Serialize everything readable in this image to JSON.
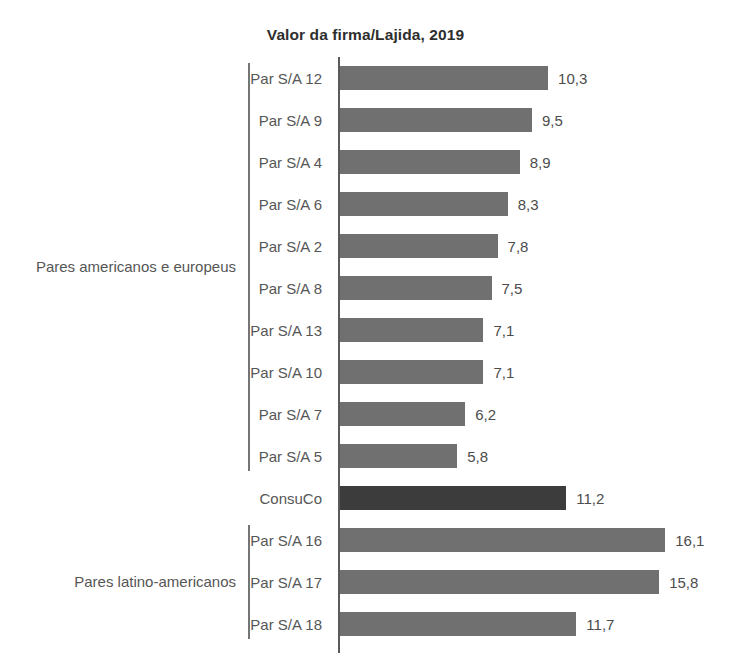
{
  "chart_data": {
    "type": "bar",
    "orientation": "horizontal",
    "title": "Valor da firma/Lajida, 2019",
    "xlabel": "",
    "ylabel": "",
    "xlim": [
      0,
      16.1
    ],
    "grid": false,
    "legend": null,
    "categories": [
      "Par S/A 12",
      "Par S/A 9",
      "Par S/A 4",
      "Par S/A 6",
      "Par S/A 2",
      "Par S/A 8",
      "Par S/A 13",
      "Par S/A 10",
      "Par S/A 7",
      "Par S/A 5",
      "ConsuCo",
      "Par S/A 16",
      "Par S/A 17",
      "Par S/A 18"
    ],
    "values": [
      10.3,
      9.5,
      8.9,
      8.3,
      7.8,
      7.5,
      7.1,
      7.1,
      6.2,
      5.8,
      11.2,
      16.1,
      15.8,
      11.7
    ],
    "value_labels": [
      "10,3",
      "9,5",
      "8,9",
      "8,3",
      "7,8",
      "7,5",
      "7,1",
      "7,1",
      "6,2",
      "5,8",
      "11,2",
      "16,1",
      "15,8",
      "11,7"
    ],
    "highlight_index": 10,
    "colors": {
      "bar": "#707070",
      "bar_highlight": "#3c3c3c",
      "text": "#565656",
      "title": "#2e2e2e",
      "axis": "#5a5a5a",
      "background": "#ffffff"
    },
    "groups": [
      {
        "label": "Pares americanos e europeus",
        "start_index": 0,
        "end_index": 9
      },
      {
        "label": "Pares latino-americanos",
        "start_index": 11,
        "end_index": 13
      }
    ]
  }
}
